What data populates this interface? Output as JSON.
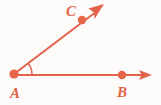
{
  "figure": {
    "background_color": "#fcfbfa",
    "stroke_color": "#e2624a",
    "point_fill_color": "#e8654a",
    "label_color": "#e2624a",
    "stroke_width": 2,
    "point_radius": 4.2,
    "arc": {
      "radius": 18,
      "start_angle_deg": 0,
      "end_angle_deg": 38
    },
    "points": [
      {
        "id": "A",
        "label": "A",
        "x": 14,
        "y": 74,
        "label_x": 10,
        "label_y": 98,
        "role": "vertex"
      },
      {
        "id": "B",
        "label": "B",
        "x": 122,
        "y": 75,
        "label_x": 117,
        "label_y": 97,
        "role": "ray-point"
      },
      {
        "id": "C",
        "label": "C",
        "x": 82,
        "y": 20,
        "label_x": 66,
        "label_y": 16,
        "role": "ray-point"
      }
    ],
    "rays": [
      {
        "id": "ray-AB",
        "name": "ray-ab",
        "from": "A",
        "through": "B",
        "tip_x": 152,
        "tip_y": 75,
        "has_arrowhead": true
      },
      {
        "id": "ray-AC",
        "name": "ray-ac",
        "from": "A",
        "through": "C",
        "tip_x": 104,
        "tip_y": 4,
        "has_arrowhead": true
      }
    ]
  }
}
